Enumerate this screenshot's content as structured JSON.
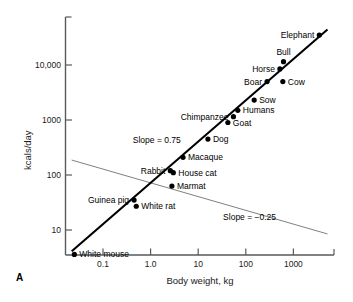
{
  "panel": {
    "label": "A"
  },
  "chart_data": {
    "type": "scatter",
    "title": "",
    "xlabel": "Body weight, kg",
    "ylabel": "kcals/day",
    "xscale": "log",
    "yscale": "log",
    "xlim": [
      0.02,
      6000
    ],
    "ylim": [
      2.2,
      60000
    ],
    "grid": false,
    "legend": "none",
    "xticks": [
      {
        "value": 0.1,
        "label": "0.1"
      },
      {
        "value": 1.0,
        "label": "1.0"
      },
      {
        "value": 10,
        "label": "10"
      },
      {
        "value": 100,
        "label": "100"
      },
      {
        "value": 1000,
        "label": "1000"
      }
    ],
    "yticks": [
      {
        "value": 10,
        "label": "10"
      },
      {
        "value": 100,
        "label": "100"
      },
      {
        "value": 1000,
        "label": "1000"
      },
      {
        "value": 10000,
        "label": "10,000"
      }
    ],
    "points": [
      {
        "name": "White mouse",
        "x": 0.025,
        "y": 3.6,
        "label": "White mouse",
        "anchor": "right"
      },
      {
        "name": "Guinea pig",
        "x": 0.45,
        "y": 35,
        "label": "Guinea pig",
        "anchor": "left"
      },
      {
        "name": "White rat",
        "x": 0.5,
        "y": 27,
        "label": "White rat",
        "anchor": "right"
      },
      {
        "name": "Rabbit",
        "x": 2.6,
        "y": 120,
        "label": "Rabbit",
        "anchor": "left"
      },
      {
        "name": "House cat",
        "x": 3.0,
        "y": 110,
        "label": "House cat",
        "anchor": "right"
      },
      {
        "name": "Marmat",
        "x": 2.8,
        "y": 63,
        "label": "Marmat",
        "anchor": "right"
      },
      {
        "name": "Macaque",
        "x": 4.8,
        "y": 210,
        "label": "Macaque",
        "anchor": "right"
      },
      {
        "name": "Dog",
        "x": 16,
        "y": 450,
        "label": "Dog",
        "anchor": "right"
      },
      {
        "name": "Goat",
        "x": 42,
        "y": 900,
        "label": "Goat",
        "anchor": "right"
      },
      {
        "name": "Chimpanzee",
        "x": 55,
        "y": 1150,
        "label": "Chimpanzee",
        "anchor": "left"
      },
      {
        "name": "Humans",
        "x": 68,
        "y": 1500,
        "label": "Humans",
        "anchor": "right"
      },
      {
        "name": "Sow",
        "x": 150,
        "y": 2300,
        "label": "Sow",
        "anchor": "right"
      },
      {
        "name": "Boar",
        "x": 280,
        "y": 5000,
        "label": "Boar",
        "anchor": "left"
      },
      {
        "name": "Cow",
        "x": 600,
        "y": 5000,
        "label": "Cow",
        "anchor": "right"
      },
      {
        "name": "Horse",
        "x": 520,
        "y": 8500,
        "label": "Horse",
        "anchor": "left"
      },
      {
        "name": "Bull",
        "x": 620,
        "y": 11500,
        "label": "Bull",
        "anchor": "above"
      },
      {
        "name": "Elephant",
        "x": 3500,
        "y": 35000,
        "label": "Elephant",
        "anchor": "left"
      }
    ],
    "lines": [
      {
        "name": "metabolic-rate-line",
        "slope": 0.75,
        "label": "Slope = 0.75",
        "label_x": 1.35,
        "label_y": 430,
        "style": "thick",
        "x_start": 0.022,
        "x_end": 5200
      },
      {
        "name": "mass-specific-line",
        "slope": -0.25,
        "label": "Slope = −0.25",
        "label_x": 120,
        "label_y": 17,
        "style": "thin",
        "x_start": 0.022,
        "x_end": 5200
      }
    ]
  }
}
